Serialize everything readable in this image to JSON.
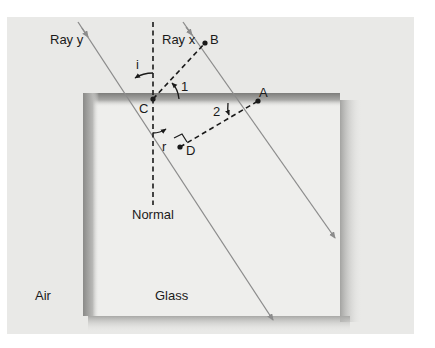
{
  "figure": {
    "labels": {
      "ray_y": "Ray y",
      "ray_x": "Ray x",
      "point_b": "B",
      "point_c": "C",
      "point_a": "A",
      "point_d": "D",
      "angle_i": "i",
      "angle_r": "r",
      "angle_1": "1",
      "angle_2": "2",
      "normal": "Normal",
      "air": "Air",
      "glass": "Glass"
    },
    "colors": {
      "background_panel": "#e9e9e7",
      "glass_face": "#eeeeec",
      "glass_edge_shadow": "#8a8a88",
      "ray": "#8c8c8c",
      "dashed": "#1a1a1a",
      "text": "#1a1a1a"
    }
  }
}
